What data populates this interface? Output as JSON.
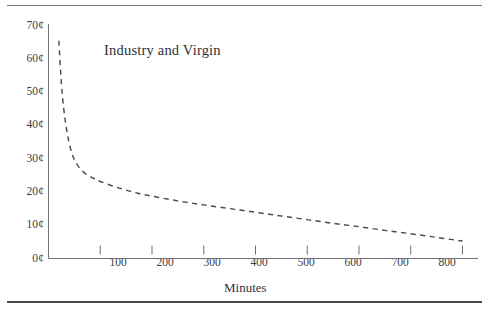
{
  "figure": {
    "background_color": "#ffffff",
    "rule_color": "#7b7b85",
    "has_top_rule": true,
    "has_bottom_rule": true
  },
  "chart_data": {
    "type": "line",
    "title": "",
    "series_label": "Industry and Virgin",
    "xlabel": "Minutes",
    "ylabel": "",
    "xlim": [
      0,
      830
    ],
    "ylim": [
      0,
      70
    ],
    "grid": false,
    "legend_position": "inline-annotation",
    "line_style": "dashed",
    "line_color": "#4b4b57",
    "x_tick_labels": [
      "100",
      "200",
      "300",
      "400",
      "500",
      "600",
      "700",
      "800"
    ],
    "x_ticks": [
      100,
      200,
      300,
      400,
      500,
      600,
      700,
      800
    ],
    "y_tick_labels": [
      "0¢",
      "10¢",
      "20¢",
      "30¢",
      "40¢",
      "50¢",
      "60¢",
      "70¢"
    ],
    "y_ticks": [
      0,
      10,
      20,
      30,
      40,
      50,
      60,
      70
    ],
    "y_unit": "¢",
    "x": [
      20,
      25,
      30,
      35,
      40,
      45,
      50,
      60,
      70,
      80,
      90,
      100,
      125,
      150,
      175,
      200,
      250,
      300,
      350,
      400,
      450,
      500,
      550,
      600,
      650,
      700,
      750,
      800
    ],
    "y": [
      65.0,
      52.0,
      44.0,
      38.5,
      34.5,
      31.5,
      29.5,
      27.0,
      25.5,
      24.5,
      23.7,
      23.0,
      21.6,
      20.4,
      19.4,
      18.6,
      17.2,
      16.0,
      14.9,
      13.8,
      12.7,
      11.6,
      10.5,
      9.5,
      8.4,
      7.4,
      6.3,
      5.2
    ]
  },
  "annotations": {
    "series_text": "Industry and Virgin",
    "x_axis_title": "Minutes"
  }
}
